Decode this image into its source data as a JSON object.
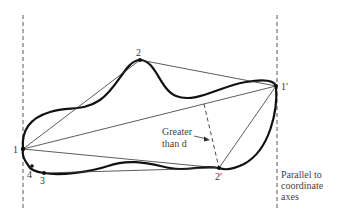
{
  "figure": {
    "type": "diagram",
    "points": [
      {
        "id": "p1",
        "label": "1",
        "x": 23,
        "y": 149
      },
      {
        "id": "p2",
        "label": "2",
        "x": 140,
        "y": 60
      },
      {
        "id": "p3",
        "label": "3",
        "x": 44,
        "y": 173
      },
      {
        "id": "p4",
        "label": "4",
        "x": 32,
        "y": 166
      },
      {
        "id": "p1prime",
        "label": "1′",
        "x": 276,
        "y": 86
      },
      {
        "id": "p2prime",
        "label": "2′",
        "x": 219,
        "y": 168
      }
    ],
    "annotations": {
      "distance_label_line1": "Greater",
      "distance_label_line2": "than d",
      "axes_note_line1": "Parallel to",
      "axes_note_line2": "coordinate",
      "axes_note_line3": "axes"
    },
    "colors": {
      "curve": "#111111",
      "chord": "#333333",
      "dashed": "#555555",
      "background": "#ffffff"
    }
  }
}
